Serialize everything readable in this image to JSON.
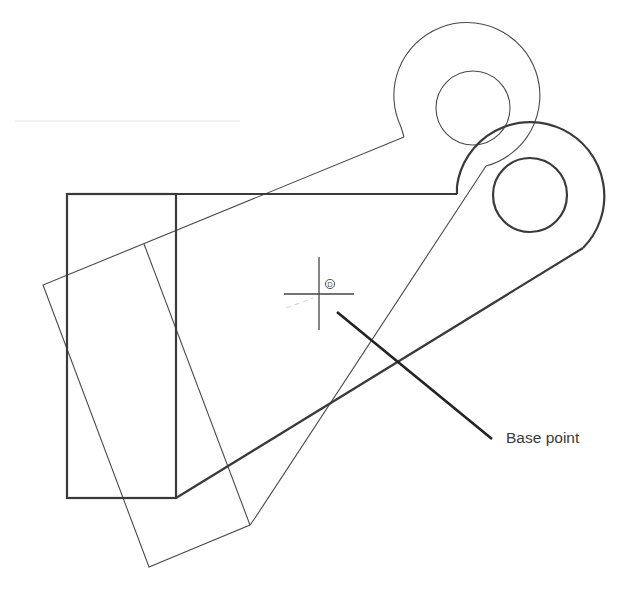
{
  "diagram": {
    "annotation": {
      "label": "Base point"
    },
    "snap_marker": {
      "glyph": "D"
    },
    "colors": {
      "background": "#ffffff",
      "line_bold": "#3a3a3a",
      "line_thin": "#4a4a4a",
      "leader": "#222222",
      "faint": "#e6e6e6"
    },
    "objects": {
      "original": {
        "rect_outer": {
          "x": 67,
          "y": 194,
          "right": 176,
          "bottom": 498
        },
        "top_edge_end_x": 457,
        "lug": {
          "cx": 530,
          "cy": 195,
          "r_outer": 74,
          "r_inner": 37
        }
      },
      "rotated_copy": {
        "corners": [
          [
            43,
            285
          ],
          [
            149,
            567
          ],
          [
            250,
            525
          ],
          [
            144,
            244
          ]
        ],
        "lug": {
          "cx": 473,
          "cy": 107,
          "r_outer": 73,
          "r_inner": 37
        }
      },
      "base_point": {
        "x": 319,
        "y": 294
      }
    }
  }
}
